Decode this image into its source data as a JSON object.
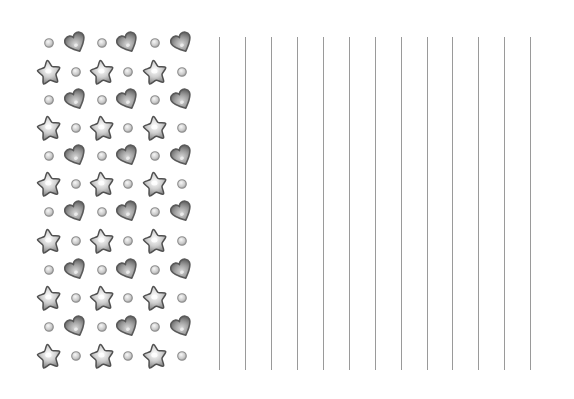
{
  "page": {
    "background": "#ffffff"
  },
  "pattern": {
    "columns_x": [
      49,
      76,
      102,
      128,
      155,
      182
    ],
    "rows": [
      {
        "y": 43,
        "type": "heart-row",
        "items": [
          "circle",
          "heart",
          "circle",
          "heart",
          "circle",
          "heart"
        ]
      },
      {
        "y": 72,
        "type": "star-row",
        "items": [
          "star",
          "circle",
          "star",
          "circle",
          "star",
          "circle"
        ]
      },
      {
        "y": 100,
        "type": "heart-row",
        "items": [
          "circle",
          "heart",
          "circle",
          "heart",
          "circle",
          "heart"
        ]
      },
      {
        "y": 128,
        "type": "star-row",
        "items": [
          "star",
          "circle",
          "star",
          "circle",
          "star",
          "circle"
        ]
      },
      {
        "y": 156,
        "type": "heart-row",
        "items": [
          "circle",
          "heart",
          "circle",
          "heart",
          "circle",
          "heart"
        ]
      },
      {
        "y": 184,
        "type": "star-row",
        "items": [
          "star",
          "circle",
          "star",
          "circle",
          "star",
          "circle"
        ]
      },
      {
        "y": 212,
        "type": "heart-row",
        "items": [
          "circle",
          "heart",
          "circle",
          "heart",
          "circle",
          "heart"
        ]
      },
      {
        "y": 241,
        "type": "star-row",
        "items": [
          "star",
          "circle",
          "star",
          "circle",
          "star",
          "circle"
        ]
      },
      {
        "y": 270,
        "type": "heart-row",
        "items": [
          "circle",
          "heart",
          "circle",
          "heart",
          "circle",
          "heart"
        ]
      },
      {
        "y": 298,
        "type": "star-row",
        "items": [
          "star",
          "circle",
          "star",
          "circle",
          "star",
          "circle"
        ]
      },
      {
        "y": 327,
        "type": "heart-row",
        "items": [
          "circle",
          "heart",
          "circle",
          "heart",
          "circle",
          "heart"
        ]
      },
      {
        "y": 356,
        "type": "star-row",
        "items": [
          "star",
          "circle",
          "star",
          "circle",
          "star",
          "circle"
        ]
      }
    ],
    "colors": {
      "outline": "#555555",
      "fill_light": "#f2f2f2",
      "fill_mid": "#b5b5b5",
      "fill_dark": "#7a7a7a"
    }
  },
  "ruled_lines": {
    "count": 13,
    "x_positions": [
      219,
      245,
      271,
      297,
      323,
      349,
      375,
      401,
      427,
      452,
      478,
      504,
      530
    ],
    "top": 37,
    "bottom": 370,
    "color": "#9a9a9a",
    "width": 1
  }
}
